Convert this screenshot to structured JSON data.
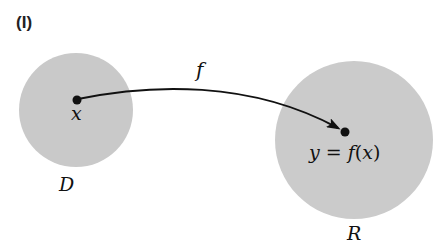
{
  "panel_label": "(I)",
  "domain_set": {
    "label": "D",
    "point_label": "x",
    "fill": "#c9c9c9"
  },
  "range_set": {
    "label": "R",
    "point_label": "y = f(x)",
    "fill": "#cbcbcb"
  },
  "mapping": {
    "label": "f",
    "stroke": "#111111"
  }
}
